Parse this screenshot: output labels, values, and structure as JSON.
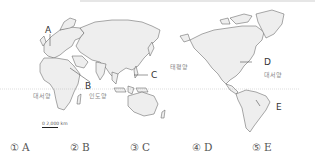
{
  "map": {
    "markers": [
      {
        "id": "A",
        "label": "A"
      },
      {
        "id": "B",
        "label": "B"
      },
      {
        "id": "C",
        "label": "C"
      },
      {
        "id": "D",
        "label": "D"
      },
      {
        "id": "E",
        "label": "E"
      }
    ],
    "oceans": {
      "atlantic_west": "대서양",
      "indian": "인도양",
      "pacific": "태평양",
      "atlantic_east": "대서양"
    },
    "scale": "0   2,000 km"
  },
  "choices": [
    {
      "num": "①",
      "label": "A"
    },
    {
      "num": "②",
      "label": "B"
    },
    {
      "num": "③",
      "label": "C"
    },
    {
      "num": "④",
      "label": "D"
    },
    {
      "num": "⑤",
      "label": "E"
    }
  ]
}
